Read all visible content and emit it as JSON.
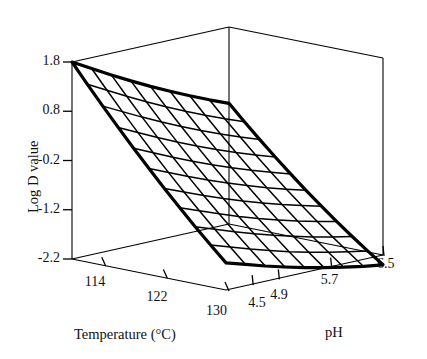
{
  "figure": {
    "type": "3d-surface-wireframe",
    "background_color": "#ffffff",
    "line_color": "#000000"
  },
  "axes": {
    "z": {
      "title": "Log D value",
      "ticks": [
        "1.8",
        "0.8",
        "-0.2",
        "-1.2",
        "-2.2"
      ],
      "values": [
        1.8,
        0.8,
        -0.2,
        -1.2,
        -2.2
      ],
      "range": [
        -2.2,
        1.8
      ]
    },
    "x": {
      "title": "Temperature (°C)",
      "ticks": [
        "114",
        "122",
        "130"
      ],
      "values": [
        114,
        122,
        130
      ],
      "range": [
        110,
        130
      ]
    },
    "y": {
      "title": "pH",
      "ticks": [
        "4.5",
        "4.9",
        "5.7",
        "6.5"
      ],
      "values": [
        4.5,
        4.9,
        5.7,
        6.5
      ],
      "range": [
        4.1,
        6.5
      ]
    }
  },
  "chart_data": {
    "type": "surface",
    "title": "",
    "xlabel": "Temperature (°C)",
    "ylabel": "pH",
    "zlabel": "Log D value",
    "xlim": [
      110,
      130
    ],
    "ylim": [
      4.1,
      6.5
    ],
    "zlim": [
      -2.2,
      1.8
    ],
    "grid": false,
    "legend": "none",
    "x": [
      110,
      112,
      114,
      116,
      118,
      120,
      122,
      124,
      126,
      128,
      130
    ],
    "y": [
      4.1,
      4.4,
      4.7,
      5.0,
      5.3,
      5.6,
      5.9,
      6.2,
      6.5
    ],
    "z": [
      [
        1.8,
        1.58,
        1.36,
        1.15,
        0.95,
        0.76,
        0.58,
        0.41,
        0.25
      ],
      [
        1.41,
        1.2,
        0.99,
        0.79,
        0.6,
        0.42,
        0.25,
        0.09,
        -0.06
      ],
      [
        1.03,
        0.83,
        0.63,
        0.44,
        0.26,
        0.09,
        -0.07,
        -0.22,
        -0.36
      ],
      [
        0.66,
        0.47,
        0.28,
        0.1,
        -0.07,
        -0.23,
        -0.38,
        -0.52,
        -0.65
      ],
      [
        0.3,
        0.12,
        -0.06,
        -0.23,
        -0.39,
        -0.54,
        -0.68,
        -0.81,
        -0.93
      ],
      [
        -0.05,
        -0.22,
        -0.39,
        -0.55,
        -0.7,
        -0.84,
        -0.97,
        -1.09,
        -1.2
      ],
      [
        -0.39,
        -0.55,
        -0.71,
        -0.86,
        -1.0,
        -1.13,
        -1.25,
        -1.36,
        -1.46
      ],
      [
        -0.72,
        -0.87,
        -1.02,
        -1.16,
        -1.29,
        -1.41,
        -1.52,
        -1.62,
        -1.71
      ],
      [
        -1.04,
        -1.18,
        -1.32,
        -1.45,
        -1.57,
        -1.68,
        -1.78,
        -1.87,
        -1.95
      ],
      [
        -1.35,
        -1.48,
        -1.61,
        -1.73,
        -1.84,
        -1.94,
        -2.03,
        -2.11,
        -2.18
      ],
      [
        -1.65,
        -1.77,
        -1.89,
        -2.0,
        -2.1,
        -2.19,
        -2.27,
        -2.34,
        -2.4
      ]
    ]
  }
}
